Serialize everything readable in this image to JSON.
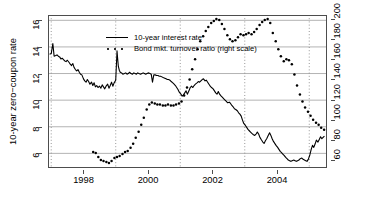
{
  "chart_data": {
    "type": "line",
    "title": "",
    "xlabel": "",
    "ylabel": "10-year zero−coupon rate",
    "ylabel_right": "",
    "xlim": [
      1996.9,
      2005.55
    ],
    "ylim": [
      4.9,
      16.4
    ],
    "ylim_right": [
      52,
      204
    ],
    "xticks": [
      1998,
      2000,
      2002,
      2004
    ],
    "xtick_labels": [
      "1998",
      "2000",
      "2002",
      "2004"
    ],
    "yticks_left": [
      6,
      8,
      10,
      12,
      14,
      16
    ],
    "ytick_labels_left": [
      "6",
      "8",
      "10",
      "12",
      "14",
      "16"
    ],
    "yticks_right": [
      60,
      80,
      100,
      120,
      140,
      160,
      180,
      200
    ],
    "ytick_labels_right": [
      "60",
      "80",
      "100",
      "120",
      "140",
      "160",
      "180",
      "200"
    ],
    "grid": {
      "horizontal": true,
      "horizontal_at": [
        6,
        8,
        10,
        12,
        14,
        16
      ],
      "horizontal_color": "#b3b3b3",
      "vertical": true,
      "vertical_at": [
        1997,
        1999,
        2001,
        2003,
        2005
      ],
      "vertical_color": "#8c8c8c",
      "vertical_style": "dotted"
    },
    "legend": {
      "position": "top-left",
      "entries": [
        {
          "label": "10-year interest rate",
          "style": "solid",
          "color": "#000000",
          "axis": "left"
        },
        {
          "label": "Bond mkt. turnover ratio (right scale)",
          "style": "dotted",
          "color": "#000000",
          "axis": "right"
        }
      ]
    },
    "series": [
      {
        "name": "10-year interest rate",
        "axis": "left",
        "style": "solid",
        "color": "#000000",
        "x": [
          1996.95,
          1997.0,
          1997.05,
          1997.09,
          1997.14,
          1997.18,
          1997.22,
          1997.26,
          1997.3,
          1997.34,
          1997.38,
          1997.42,
          1997.46,
          1997.5,
          1997.55,
          1997.59,
          1997.63,
          1997.67,
          1997.71,
          1997.75,
          1997.79,
          1997.83,
          1997.87,
          1997.91,
          1997.95,
          1998.0,
          1998.04,
          1998.08,
          1998.12,
          1998.16,
          1998.2,
          1998.25,
          1998.29,
          1998.33,
          1998.37,
          1998.41,
          1998.45,
          1998.5,
          1998.54,
          1998.58,
          1998.62,
          1998.66,
          1998.7,
          1998.75,
          1998.79,
          1998.83,
          1998.87,
          1998.91,
          1998.95,
          1999.0,
          1999.04,
          1999.06,
          1999.08,
          1999.11,
          1999.14,
          1999.18,
          1999.22,
          1999.27,
          1999.31,
          1999.35,
          1999.39,
          1999.43,
          1999.47,
          1999.52,
          1999.56,
          1999.6,
          1999.64,
          1999.68,
          1999.72,
          1999.77,
          1999.81,
          1999.85,
          1999.89,
          1999.93,
          1999.97,
          2000.02,
          2000.06,
          2000.1,
          2000.14,
          2000.18,
          2000.22,
          2000.27,
          2000.31,
          2000.35,
          2000.39,
          2000.43,
          2000.47,
          2000.52,
          2000.56,
          2000.6,
          2000.64,
          2000.68,
          2000.72,
          2000.77,
          2000.81,
          2000.85,
          2000.89,
          2000.93,
          2000.97,
          2001.02,
          2001.06,
          2001.1,
          2001.14,
          2001.18,
          2001.22,
          2001.27,
          2001.31,
          2001.35,
          2001.39,
          2001.43,
          2001.47,
          2001.52,
          2001.56,
          2001.6,
          2001.64,
          2001.68,
          2001.72,
          2001.77,
          2001.81,
          2001.85,
          2001.89,
          2001.93,
          2001.97,
          2002.02,
          2002.06,
          2002.1,
          2002.14,
          2002.18,
          2002.22,
          2002.27,
          2002.31,
          2002.35,
          2002.39,
          2002.43,
          2002.47,
          2002.52,
          2002.56,
          2002.6,
          2002.64,
          2002.68,
          2002.72,
          2002.77,
          2002.81,
          2002.85,
          2002.89,
          2002.93,
          2002.97,
          2003.02,
          2003.06,
          2003.1,
          2003.14,
          2003.18,
          2003.22,
          2003.27,
          2003.31,
          2003.35,
          2003.39,
          2003.43,
          2003.47,
          2003.52,
          2003.56,
          2003.6,
          2003.64,
          2003.68,
          2003.72,
          2003.77,
          2003.81,
          2003.85,
          2003.89,
          2003.93,
          2003.97,
          2004.02,
          2004.06,
          2004.1,
          2004.14,
          2004.18,
          2004.22,
          2004.27,
          2004.31,
          2004.35,
          2004.39,
          2004.43,
          2004.47,
          2004.52,
          2004.56,
          2004.6,
          2004.64,
          2004.68,
          2004.72,
          2004.77,
          2004.81,
          2004.85,
          2004.89,
          2004.93,
          2004.97,
          2005.02,
          2005.06,
          2005.1,
          2005.14,
          2005.18,
          2005.22,
          2005.27,
          2005.31,
          2005.35,
          2005.39,
          2005.43,
          2005.47
        ],
        "y": [
          13.45,
          13.5,
          14.25,
          13.3,
          13.35,
          13.4,
          13.3,
          13.25,
          13.1,
          13.15,
          13.05,
          12.95,
          12.9,
          13.0,
          12.85,
          12.7,
          12.6,
          12.75,
          12.45,
          12.3,
          12.2,
          12.3,
          12.1,
          11.95,
          11.9,
          11.6,
          11.45,
          11.35,
          11.55,
          11.4,
          11.2,
          11.35,
          11.1,
          11.3,
          11.0,
          11.1,
          10.95,
          11.05,
          10.9,
          11.15,
          11.0,
          10.85,
          11.05,
          11.2,
          10.9,
          11.1,
          11.35,
          11.05,
          11.3,
          11.5,
          13.7,
          13.1,
          12.55,
          12.25,
          12.1,
          12.05,
          11.95,
          12.0,
          12.05,
          11.95,
          12.0,
          12.1,
          12.0,
          11.95,
          12.05,
          12.0,
          11.95,
          12.05,
          12.0,
          11.95,
          12.0,
          12.05,
          12.0,
          11.95,
          12.0,
          12.05,
          12.0,
          11.95,
          11.35,
          11.9,
          11.9,
          11.85,
          11.85,
          11.8,
          11.8,
          11.75,
          11.7,
          11.65,
          11.6,
          11.55,
          11.55,
          11.5,
          11.4,
          11.3,
          11.2,
          11.1,
          10.95,
          10.8,
          10.6,
          10.45,
          10.3,
          10.4,
          10.55,
          10.7,
          10.45,
          10.7,
          10.95,
          11.05,
          10.95,
          11.1,
          11.2,
          11.3,
          11.4,
          11.35,
          11.45,
          11.55,
          11.6,
          11.45,
          11.5,
          11.35,
          11.2,
          11.05,
          10.95,
          10.85,
          10.7,
          10.55,
          10.45,
          10.65,
          10.45,
          10.3,
          10.2,
          10.1,
          10.0,
          9.9,
          9.8,
          9.85,
          9.75,
          9.6,
          9.5,
          9.35,
          9.3,
          9.2,
          9.05,
          8.95,
          8.8,
          8.5,
          8.25,
          8.1,
          7.95,
          7.8,
          7.7,
          7.6,
          7.5,
          7.4,
          7.35,
          7.45,
          7.6,
          7.45,
          7.2,
          7.0,
          6.85,
          6.75,
          6.95,
          7.1,
          7.3,
          7.55,
          7.35,
          7.1,
          6.9,
          6.75,
          6.6,
          6.45,
          6.3,
          6.15,
          6.05,
          5.95,
          5.85,
          5.7,
          5.6,
          5.5,
          5.45,
          5.4,
          5.45,
          5.5,
          5.45,
          5.4,
          5.45,
          5.5,
          5.6,
          5.65,
          5.55,
          5.5,
          5.45,
          5.4,
          5.55,
          5.9,
          6.3,
          6.6,
          6.45,
          6.7,
          7.0,
          6.85,
          7.05,
          7.25,
          7.1,
          7.2,
          7.3
        ]
      },
      {
        "name": "Bond mkt. turnover ratio (right scale)",
        "axis": "right",
        "style": "dotted",
        "color": "#000000",
        "x": [
          1998.3,
          1998.38,
          1998.46,
          1998.54,
          1998.62,
          1998.71,
          1998.79,
          1998.87,
          1998.96,
          1999.04,
          1999.12,
          1999.21,
          1999.29,
          1999.37,
          1999.46,
          1999.54,
          1999.62,
          1999.71,
          1999.79,
          1999.87,
          1999.96,
          2000.04,
          2000.12,
          2000.21,
          2000.29,
          2000.37,
          2000.46,
          2000.54,
          2000.62,
          2000.71,
          2000.79,
          2000.87,
          2000.96,
          2001.04,
          2001.12,
          2001.21,
          2001.29,
          2001.37,
          2001.46,
          2001.54,
          2001.62,
          2001.71,
          2001.79,
          2001.87,
          2001.96,
          2002.04,
          2002.12,
          2002.21,
          2002.29,
          2002.37,
          2002.46,
          2002.54,
          2002.62,
          2002.71,
          2002.79,
          2002.87,
          2002.96,
          2003.04,
          2003.12,
          2003.21,
          2003.29,
          2003.37,
          2003.46,
          2003.54,
          2003.62,
          2003.71,
          2003.79,
          2003.87,
          2003.96,
          2004.04,
          2004.12,
          2004.21,
          2004.29,
          2004.37,
          2004.46,
          2004.54,
          2004.62,
          2004.71,
          2004.79,
          2004.87,
          2004.96,
          2005.04,
          2005.12,
          2005.21,
          2005.29,
          2005.37,
          2005.46
        ],
        "y": [
          68,
          67,
          63,
          60,
          59,
          58,
          57,
          59,
          62,
          63,
          64,
          66,
          68,
          69,
          72,
          76,
          82,
          88,
          95,
          102,
          110,
          115,
          117,
          116,
          115,
          115,
          114,
          114,
          115,
          114,
          114,
          115,
          116,
          118,
          124,
          132,
          140,
          150,
          160,
          170,
          178,
          183,
          188,
          192,
          196,
          198,
          200,
          199,
          195,
          190,
          184,
          180,
          178,
          179,
          182,
          185,
          184,
          185,
          186,
          185,
          187,
          190,
          194,
          197,
          199,
          200,
          196,
          186,
          178,
          170,
          163,
          158,
          160,
          159,
          155,
          145,
          134,
          125,
          118,
          112,
          108,
          104,
          100,
          97,
          95,
          92,
          90
        ]
      }
    ]
  },
  "axes": {
    "ylabel_left": "10-year zero−coupon rate"
  }
}
